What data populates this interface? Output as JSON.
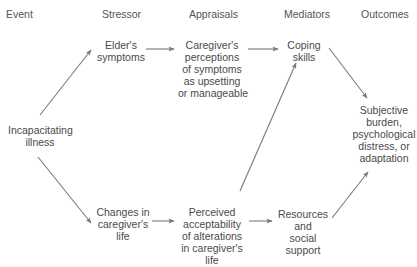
{
  "headers": {
    "event": "Event",
    "stressor": "Stressor",
    "appraisals": "Appraisals",
    "mediators": "Mediators",
    "outcomes": "Outcomes"
  },
  "nodes": {
    "incapacitating_illness": [
      "Incapacitating",
      "illness"
    ],
    "elders_symptoms": [
      "Elder's",
      "symptoms"
    ],
    "changes_in_life": [
      "Changes in",
      "caregiver's",
      "life"
    ],
    "caregiver_perceptions": [
      "Caregiver's",
      "perceptions",
      "of symptoms",
      "as upsetting",
      "or manageable"
    ],
    "perceived_acceptability": [
      "Perceived",
      "acceptability",
      "of alterations",
      "in caregiver's",
      "life"
    ],
    "coping_skills": [
      "Coping",
      "skills"
    ],
    "resources_support": [
      "Resources",
      "and",
      "social",
      "support"
    ],
    "outcomes": [
      "Subjective",
      "burden,",
      "psychological",
      "distress, or",
      "adaptation"
    ]
  },
  "edges": [
    {
      "from": "incapacitating_illness",
      "to": "elders_symptoms"
    },
    {
      "from": "incapacitating_illness",
      "to": "changes_in_life"
    },
    {
      "from": "elders_symptoms",
      "to": "caregiver_perceptions"
    },
    {
      "from": "changes_in_life",
      "to": "perceived_acceptability"
    },
    {
      "from": "caregiver_perceptions",
      "to": "coping_skills"
    },
    {
      "from": "perceived_acceptability",
      "to": "coping_skills"
    },
    {
      "from": "perceived_acceptability",
      "to": "resources_support"
    },
    {
      "from": "coping_skills",
      "to": "outcomes"
    },
    {
      "from": "resources_support",
      "to": "outcomes"
    }
  ],
  "colors": {
    "arrow": "#7a7a7a",
    "text": "#4a4a4a"
  }
}
